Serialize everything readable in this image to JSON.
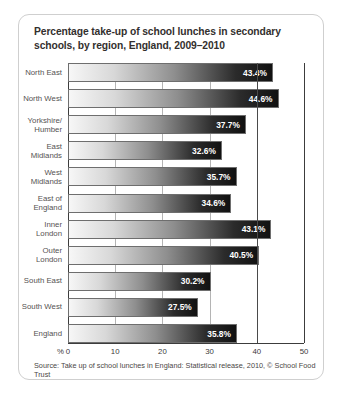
{
  "card": {
    "title": "Percentage take-up of school lunches in secondary schools, by region, England, 2009–2010",
    "source": "Source: Take up of school lunches in England: Statistical release, 2010, © School Food Trust"
  },
  "chart_data": {
    "type": "bar",
    "orientation": "horizontal",
    "title": "Percentage take-up of school lunches in secondary schools, by region, England, 2009–2010",
    "xlabel": "%",
    "ylabel": "",
    "xlim": [
      0,
      50
    ],
    "xticks": [
      "0",
      "10",
      "20",
      "30",
      "40",
      "50"
    ],
    "grid": true,
    "legend": false,
    "value_suffix": "%",
    "categories": [
      "North East",
      "North West",
      "Yorkshire/\nHumber",
      "East\nMidlands",
      "West\nMidlands",
      "East of\nEngland",
      "Inner\nLondon",
      "Outer\nLondon",
      "South East",
      "South West",
      "England"
    ],
    "values": [
      43.4,
      44.6,
      37.7,
      32.6,
      35.7,
      34.6,
      43.1,
      40.5,
      30.2,
      27.5,
      35.8
    ],
    "value_labels": [
      "43.4%",
      "44.6%",
      "37.7%",
      "32.6%",
      "35.7%",
      "34.6%",
      "43.1%",
      "40.5%",
      "30.2%",
      "27.5%",
      "35.8%"
    ],
    "annotations": [
      {
        "name": "emphasis-gridline",
        "value": 40
      }
    ],
    "colors": {
      "bar_gradient_start": "#f7f7f7",
      "bar_gradient_end": "#111111",
      "bar_border": "#6e6e6e",
      "value_label": "#ffffff",
      "gridline": "#b4b4b4",
      "gridline_strong": "#4a4a4a",
      "axis": "#3c3c3c",
      "title": "#332f2e",
      "category_label": "#555252",
      "card_border": "#cfcfcf"
    }
  }
}
